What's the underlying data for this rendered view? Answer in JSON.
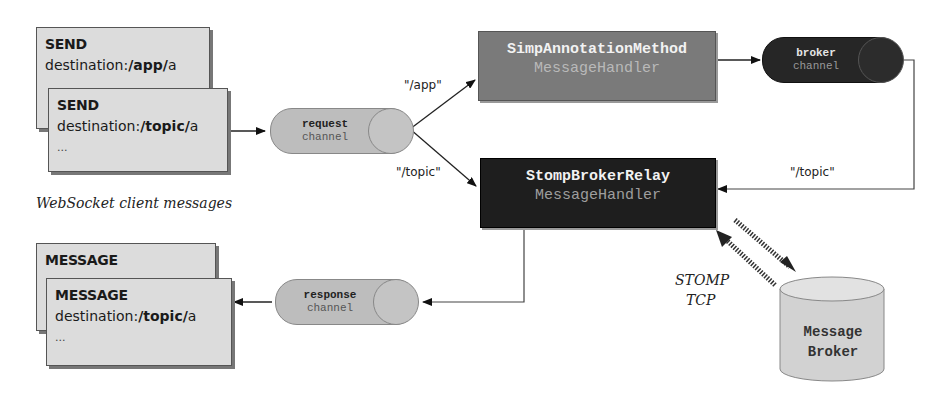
{
  "client_caption": "WebSocket client messages",
  "inbound_messages": [
    {
      "kind": "SEND",
      "dest_prefix": "destination:",
      "dest_bold": "/app/",
      "dest_suffix": "a"
    },
    {
      "kind": "SEND",
      "dest_prefix": "destination:",
      "dest_bold": "/topic/",
      "dest_suffix": "a",
      "more": "..."
    }
  ],
  "outbound_messages": [
    {
      "kind": "MESSAGE"
    },
    {
      "kind": "MESSAGE",
      "dest_prefix": "destination:",
      "dest_bold": "/topic/",
      "dest_suffix": "a",
      "more": "..."
    }
  ],
  "channels": {
    "request": {
      "line1": "request",
      "line2": "channel"
    },
    "response": {
      "line1": "response",
      "line2": "channel"
    },
    "broker": {
      "line1": "broker",
      "line2": "channel"
    }
  },
  "handlers": {
    "annotation": {
      "line1": "SimpAnnotationMethod",
      "line2": "MessageHandler"
    },
    "relay": {
      "line1": "StompBrokerRelay",
      "line2": "MessageHandler"
    }
  },
  "route_labels": {
    "app": "\"/app\"",
    "topic": "\"/topic\"",
    "broker_topic": "\"/topic\""
  },
  "protocol_label": {
    "line1": "STOMP",
    "line2": "TCP"
  },
  "message_broker": {
    "line1": "Message",
    "line2": "Broker"
  },
  "colors": {
    "card_bg": "#dcdcdc",
    "annotation_handler": "#7a7a7a",
    "relay_handler": "#1e1e1e",
    "broker_channel": "#262626",
    "light_channel": "#bdbdbd",
    "db": "#d2d2d2"
  }
}
